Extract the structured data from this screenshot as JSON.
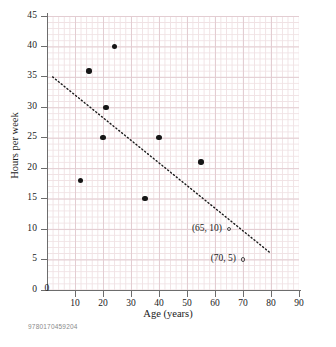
{
  "chart_data": {
    "type": "scatter",
    "title": "",
    "xlabel": "Age (years)",
    "ylabel": "Hours per week",
    "xlim": [
      0,
      90
    ],
    "ylim": [
      0,
      45
    ],
    "xticks": [
      0,
      10,
      20,
      30,
      40,
      50,
      60,
      70,
      80,
      90
    ],
    "yticks": [
      0,
      5,
      10,
      15,
      20,
      25,
      30,
      35,
      40,
      45
    ],
    "grid": true,
    "legend": "none",
    "series": [
      {
        "name": "observed data",
        "marker": "filled-circle",
        "points": [
          {
            "x": 12,
            "y": 18
          },
          {
            "x": 15,
            "y": 36
          },
          {
            "x": 20,
            "y": 25
          },
          {
            "x": 21,
            "y": 30
          },
          {
            "x": 24,
            "y": 40
          },
          {
            "x": 35,
            "y": 15
          },
          {
            "x": 40,
            "y": 25
          },
          {
            "x": 55,
            "y": 21
          }
        ]
      },
      {
        "name": "annotated points",
        "marker": "open-circle",
        "points": [
          {
            "x": 65,
            "y": 10,
            "label": "(65, 10)"
          },
          {
            "x": 70,
            "y": 5,
            "label": "(70, 5)"
          }
        ]
      }
    ],
    "trendline": {
      "style": "dotted",
      "x0": 2,
      "y0": 35,
      "x1": 80,
      "y1": 6
    }
  },
  "axes": {
    "x": {
      "title": "Age (years)",
      "tick_labels": [
        "0",
        "10",
        "20",
        "30",
        "40",
        "50",
        "60",
        "70",
        "80",
        "90"
      ]
    },
    "y": {
      "title": "Hours per week",
      "tick_labels": [
        "0",
        "5",
        "10",
        "15",
        "20",
        "25",
        "30",
        "35",
        "40",
        "45"
      ]
    }
  },
  "annotations": [
    {
      "text": "(65, 10)"
    },
    {
      "text": "(70, 5)"
    }
  ],
  "footer": {
    "code": "9780170459204"
  },
  "colors": {
    "marker": "#161616",
    "axis": "#6d6d6d",
    "grid_major": "#e3cdd2",
    "grid_minor": "#f0e2e4",
    "text": "#1a1a1a",
    "footer_text": "#8a8a8a"
  }
}
